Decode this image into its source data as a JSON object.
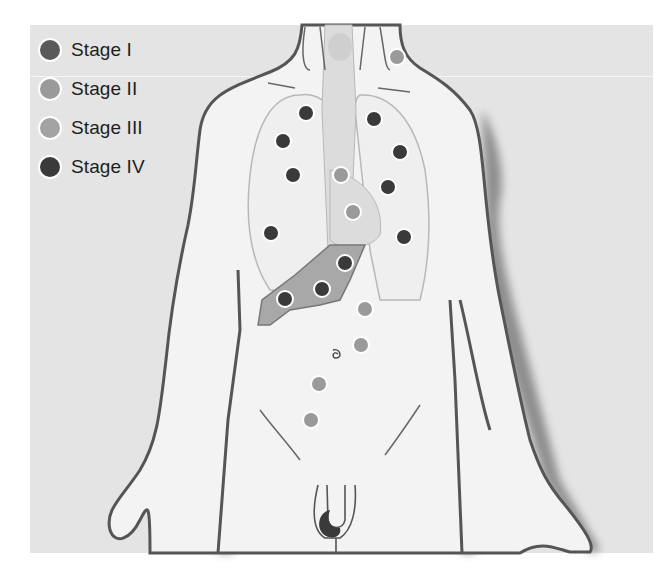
{
  "legend": {
    "items": [
      {
        "label": "Stage I",
        "color": "#5a5a5a"
      },
      {
        "label": "Stage II",
        "color": "#9a9a9a"
      },
      {
        "label": "Stage III",
        "color": "#a3a3a3"
      },
      {
        "label": "Stage IV",
        "color": "#3a3a3a"
      }
    ]
  },
  "figure": {
    "markers": [
      {
        "x": 397,
        "y": 57,
        "stage": "Stage II"
      },
      {
        "x": 306,
        "y": 113,
        "stage": "Stage IV"
      },
      {
        "x": 283,
        "y": 141,
        "stage": "Stage IV"
      },
      {
        "x": 293,
        "y": 175,
        "stage": "Stage IV"
      },
      {
        "x": 374,
        "y": 119,
        "stage": "Stage IV"
      },
      {
        "x": 400,
        "y": 152,
        "stage": "Stage IV"
      },
      {
        "x": 388,
        "y": 187,
        "stage": "Stage IV"
      },
      {
        "x": 341,
        "y": 175,
        "stage": "Stage II"
      },
      {
        "x": 353,
        "y": 212,
        "stage": "Stage II"
      },
      {
        "x": 271,
        "y": 233,
        "stage": "Stage IV"
      },
      {
        "x": 404,
        "y": 237,
        "stage": "Stage IV"
      },
      {
        "x": 345,
        "y": 263,
        "stage": "Stage IV"
      },
      {
        "x": 322,
        "y": 289,
        "stage": "Stage IV"
      },
      {
        "x": 285,
        "y": 299,
        "stage": "Stage IV"
      },
      {
        "x": 365,
        "y": 309,
        "stage": "Stage II"
      },
      {
        "x": 361,
        "y": 345,
        "stage": "Stage II"
      },
      {
        "x": 319,
        "y": 384,
        "stage": "Stage II"
      },
      {
        "x": 311,
        "y": 420,
        "stage": "Stage II"
      }
    ]
  }
}
